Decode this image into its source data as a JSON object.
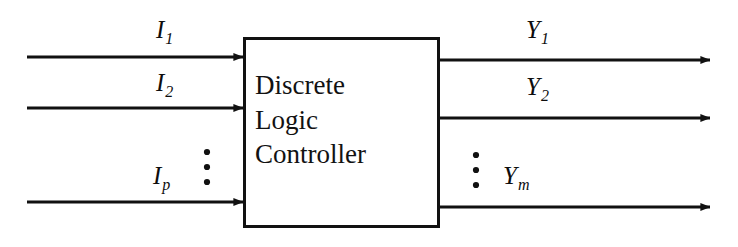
{
  "figure": {
    "type": "block-diagram",
    "background_color": "#ffffff",
    "stroke_color": "#111111",
    "block": {
      "lines": [
        "Discrete",
        "Logic",
        "Controller"
      ],
      "full_text": "Discrete Logic Controller",
      "x": 243,
      "y": 37,
      "width": 197,
      "height": 191,
      "border_width": 3
    },
    "inputs": {
      "label_prefix": "I",
      "signals": [
        {
          "base": "I",
          "subscript": "1",
          "text": "I1",
          "line_y": 57
        },
        {
          "base": "I",
          "subscript": "2",
          "text": "I2",
          "line_y": 108
        },
        {
          "base": "I",
          "subscript": "p",
          "text": "Ip",
          "line_y": 202
        }
      ],
      "line_start_x": 27,
      "line_end_x": 243,
      "ellipsis": {
        "dots": 3,
        "x": 207,
        "y_top": 152,
        "y_bottom": 182
      }
    },
    "outputs": {
      "label_prefix": "Y",
      "signals": [
        {
          "base": "Y",
          "subscript": "1",
          "text": "Y1",
          "line_y": 60
        },
        {
          "base": "Y",
          "subscript": "2",
          "text": "Y2",
          "line_y": 118
        },
        {
          "base": "Y",
          "subscript": "m",
          "text": "Ym",
          "line_y": 207
        }
      ],
      "line_start_x": 440,
      "line_end_x": 710,
      "ellipsis": {
        "dots": 3,
        "x": 476,
        "y_top": 155,
        "y_bottom": 185
      }
    }
  }
}
